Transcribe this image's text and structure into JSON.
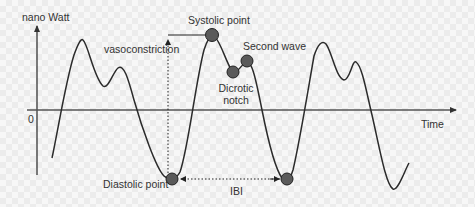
{
  "diagram": {
    "y_axis_label": "nano Watt",
    "x_axis_label": "Time",
    "origin_label": "0",
    "annotations": {
      "systolic_point": "Systolic point",
      "second_wave": "Second wave",
      "dicrotic_notch_line1": "Dicrotic",
      "dicrotic_notch_line2": "notch",
      "diastolic_point": "Diastolic point",
      "vasoconstriction": "vasoconstriction",
      "ibi": "IBI"
    },
    "colors": {
      "curve": "#2b2b2b",
      "axis": "#555555",
      "marker_fill": "#5a5a5a",
      "marker_stroke": "#222222",
      "text": "#333333"
    }
  }
}
